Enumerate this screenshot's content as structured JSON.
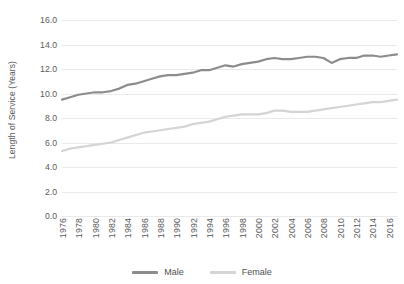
{
  "chart_data": {
    "type": "line",
    "title": "",
    "xlabel": "",
    "ylabel": "Length of Service (Years)",
    "ylim": [
      0.0,
      16.0
    ],
    "ytick_step": 2.0,
    "yticks": [
      "16.0",
      "14.0",
      "12.0",
      "10.0",
      "8.0",
      "6.0",
      "4.0",
      "2.0",
      "0.0"
    ],
    "xlim": [
      1976,
      2017
    ],
    "grid": true,
    "legend_position": "bottom-center",
    "categories": [
      1976,
      1977,
      1978,
      1979,
      1980,
      1981,
      1982,
      1983,
      1984,
      1985,
      1986,
      1987,
      1988,
      1989,
      1990,
      1991,
      1992,
      1993,
      1994,
      1995,
      1996,
      1997,
      1998,
      1999,
      2000,
      2001,
      2002,
      2003,
      2004,
      2005,
      2006,
      2007,
      2008,
      2009,
      2010,
      2011,
      2012,
      2013,
      2014,
      2015,
      2016,
      2017
    ],
    "xtick_labels": [
      "1976",
      "1978",
      "1980",
      "1982",
      "1984",
      "1986",
      "1988",
      "1990",
      "1992",
      "1994",
      "1996",
      "1998",
      "2000",
      "2002",
      "2004",
      "2006",
      "2008",
      "2010",
      "2012",
      "2014",
      "2016"
    ],
    "series": [
      {
        "name": "Male",
        "color": "#8c8c8c",
        "values": [
          9.5,
          9.7,
          9.9,
          10.0,
          10.1,
          10.1,
          10.2,
          10.4,
          10.7,
          10.8,
          11.0,
          11.2,
          11.4,
          11.5,
          11.5,
          11.6,
          11.7,
          11.9,
          11.9,
          12.1,
          12.3,
          12.2,
          12.4,
          12.5,
          12.6,
          12.8,
          12.9,
          12.8,
          12.8,
          12.9,
          13.0,
          13.0,
          12.9,
          12.5,
          12.8,
          12.9,
          12.9,
          13.1,
          13.1,
          13.0,
          13.1,
          13.2
        ]
      },
      {
        "name": "Female",
        "color": "#d4d4d4",
        "values": [
          5.3,
          5.5,
          5.6,
          5.7,
          5.8,
          5.9,
          6.0,
          6.2,
          6.4,
          6.6,
          6.8,
          6.9,
          7.0,
          7.1,
          7.2,
          7.3,
          7.5,
          7.6,
          7.7,
          7.9,
          8.1,
          8.2,
          8.3,
          8.3,
          8.3,
          8.4,
          8.6,
          8.6,
          8.5,
          8.5,
          8.5,
          8.6,
          8.7,
          8.8,
          8.9,
          9.0,
          9.1,
          9.2,
          9.3,
          9.3,
          9.4,
          9.5
        ]
      }
    ]
  },
  "legend": {
    "items": [
      {
        "label": "Male",
        "color": "#8c8c8c"
      },
      {
        "label": "Female",
        "color": "#d4d4d4"
      }
    ]
  }
}
